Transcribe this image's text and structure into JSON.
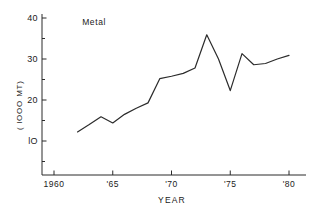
{
  "chart_data": {
    "type": "line",
    "title": "",
    "annotations": [
      {
        "text": "Metal",
        "x": 1962.4,
        "y": 38.2
      }
    ],
    "xlabel": "YEAR",
    "ylabel": "( lOOO MT)",
    "xlim": [
      1959.0,
      1981.0
    ],
    "ylim": [
      2.3,
      41.5
    ],
    "grid": false,
    "legend": null,
    "xticks": [
      1960,
      1965,
      1970,
      1975,
      1980
    ],
    "xtick_labels": [
      "1960",
      "'65",
      "'70",
      "'75",
      "'80"
    ],
    "xminor_ticks": [],
    "yticks": [
      10,
      20,
      30,
      40
    ],
    "ytick_labels": [
      "lO",
      "20",
      "30",
      "40"
    ],
    "yminor_ticks": [
      5,
      15,
      25,
      35
    ],
    "series": [
      {
        "name": "Metal",
        "x": [
          1962,
          1963,
          1964,
          1965,
          1966,
          1967,
          1968,
          1969,
          1970,
          1971,
          1972,
          1973,
          1974,
          1975,
          1976,
          1977,
          1978,
          1979,
          1980
        ],
        "values": [
          12.2,
          14.0,
          15.9,
          14.4,
          16.5,
          18.0,
          19.3,
          25.2,
          25.8,
          26.5,
          27.8,
          35.9,
          30.0,
          22.3,
          31.3,
          28.6,
          28.9,
          30.0,
          30.9
        ]
      }
    ],
    "colors": {
      "line": "#2b2b2b",
      "axis": "#2b2b2b",
      "background": "#ffffff"
    }
  }
}
